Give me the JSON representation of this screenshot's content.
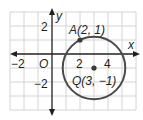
{
  "diagram": {
    "type": "coordinate-plane",
    "axes": {
      "x_label": "x",
      "y_label": "y",
      "origin_label": "O"
    },
    "x_ticks": [
      {
        "value": -2,
        "label": "−2"
      },
      {
        "value": 2,
        "label": "2"
      },
      {
        "value": 4,
        "label": "4"
      }
    ],
    "y_ticks": [
      {
        "value": 2,
        "label": "2"
      },
      {
        "value": -2,
        "label": "−2"
      }
    ],
    "points": [
      {
        "name": "A",
        "x": 2,
        "y": 1,
        "label": "A(2, 1)"
      },
      {
        "name": "Q",
        "x": 3,
        "y": -1,
        "label": "Q(3, −1)"
      }
    ],
    "circle": {
      "center": "Q",
      "cx": 3,
      "cy": -1,
      "radius": 2.236
    },
    "colors": {
      "grid": "#d4d4d4",
      "axis": "#231f20",
      "circle": "#4a4a4a",
      "point": "#3a3a3a"
    }
  }
}
